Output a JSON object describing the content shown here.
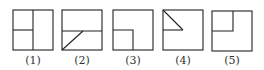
{
  "diagram": {
    "stroke_color": "#222222",
    "label_color": "#333333",
    "figures": [
      {
        "id": 1,
        "label": "(1)",
        "description": "square split by vertical center line; left half split by horizontal line"
      },
      {
        "id": 2,
        "label": "(2)",
        "description": "square split by horizontal line with diagonal from bottom-left corner to midpoint of the line"
      },
      {
        "id": 3,
        "label": "(3)",
        "description": "square with smaller quarter square in bottom-left corner"
      },
      {
        "id": 4,
        "label": "(4)",
        "description": "square with triangle in top-left quadrant (diagonal and horizontal edge)"
      },
      {
        "id": 5,
        "label": "(5)",
        "description": "square with smaller quarter square in top-left corner"
      }
    ]
  }
}
